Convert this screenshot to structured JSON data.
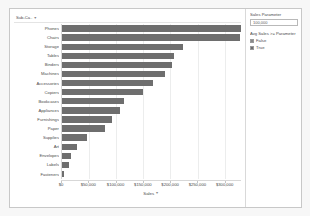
{
  "worksheet": {
    "row_header_label": "Sub-Ca..",
    "sort_icon": "sort-descending-icon"
  },
  "chart_data": {
    "type": "bar",
    "orientation": "horizontal",
    "title": "",
    "xlabel": "Sales",
    "ylabel": "Sub-Category",
    "xlim": [
      0,
      330000
    ],
    "grid": true,
    "legend_position": "right",
    "categories": [
      "Phones",
      "Chairs",
      "Storage",
      "Tables",
      "Binders",
      "Machines",
      "Accessories",
      "Copiers",
      "Bookcases",
      "Appliances",
      "Furnishings",
      "Paper",
      "Supplies",
      "Art",
      "Envelopes",
      "Labels",
      "Fasteners"
    ],
    "values": [
      330007,
      328449,
      223844,
      206966,
      203413,
      189239,
      167380,
      149528,
      114880,
      107532,
      91705,
      78479,
      46674,
      27119,
      16476,
      12486,
      3024
    ],
    "tick_labels": [
      "$0",
      "$50,000",
      "$100,000",
      "$150,000",
      "$200,000",
      "$250,000",
      "$300,000"
    ],
    "tick_values": [
      0,
      50000,
      100000,
      150000,
      200000,
      250000,
      300000
    ],
    "bar_color": "#6e6e6e"
  },
  "parameter_card": {
    "title": "Sales Parameter",
    "value": "100,000"
  },
  "legend_card": {
    "title": "Avg Sales >= Parameter",
    "items": [
      {
        "label": "False",
        "color": "#888888"
      },
      {
        "label": "True",
        "color": "#6e6e6e"
      }
    ]
  }
}
